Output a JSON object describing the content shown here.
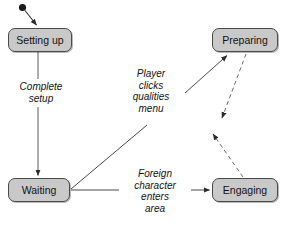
{
  "diagram": {
    "type": "state-transition-diagram",
    "background_color": "#ffffff",
    "node_fill_color": "#c9c9c9",
    "node_border_color": "#4a4a4a",
    "text_color": "#111111",
    "nodes": [
      {
        "id": "setting-up",
        "label": "Setting up"
      },
      {
        "id": "preparing",
        "label": "Preparing"
      },
      {
        "id": "waiting",
        "label": "Waiting"
      },
      {
        "id": "engaging",
        "label": "Engaging"
      }
    ],
    "start_marker": {
      "shape": "filled-circle",
      "target": "setting-up"
    },
    "edges": [
      {
        "id": "complete-setup",
        "from": "setting-up",
        "to": "waiting",
        "label": "Complete\nsetup",
        "style": "solid",
        "arrow": "single"
      },
      {
        "id": "player-clicks-qualities-menu",
        "from": "waiting",
        "to": "preparing",
        "label": "Player\nclicks\nqualities\nmenu",
        "style": "solid",
        "arrow": "single"
      },
      {
        "id": "foreign-character-enters-area",
        "from": "waiting",
        "to": "engaging",
        "label": "Foreign\ncharacter\nenters\narea",
        "style": "solid",
        "arrow": "single"
      },
      {
        "id": "preparing-dashed-out",
        "from": "preparing",
        "to": "",
        "label": "",
        "style": "dashed",
        "arrow": "single"
      },
      {
        "id": "engaging-dashed-out",
        "from": "engaging",
        "to": "",
        "label": "",
        "style": "dashed",
        "arrow": "single"
      }
    ]
  }
}
